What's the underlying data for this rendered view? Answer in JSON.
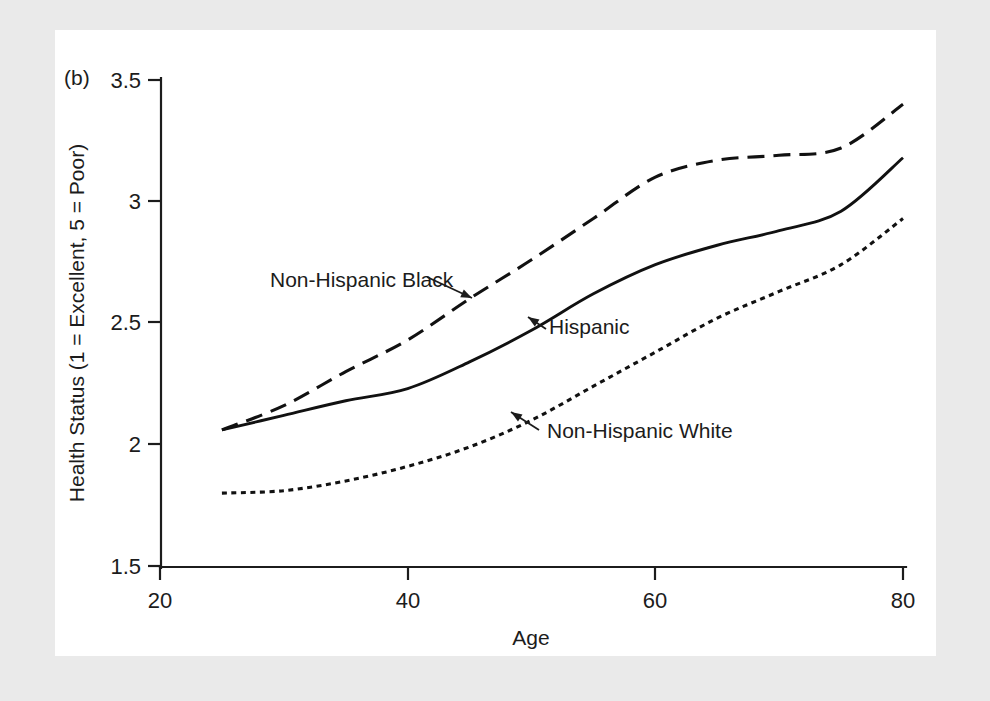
{
  "figure": {
    "panel_label": "(b)",
    "background_color": "#eaeaea",
    "plot_background_color": "#ffffff",
    "line_color": "#111111"
  },
  "chart_data": {
    "type": "line",
    "title": "",
    "subtitle": "",
    "panel": "(b)",
    "xlabel": "Age",
    "ylabel": "Health Status (1 = Excellent, 5 = Poor)",
    "xlim": [
      20,
      80
    ],
    "ylim": [
      1.5,
      3.5
    ],
    "xticks": [
      20,
      40,
      60,
      80
    ],
    "xtick_labels": [
      "20",
      "40",
      "60",
      "80"
    ],
    "yticks": [
      1.5,
      2,
      2.5,
      3,
      3.5
    ],
    "ytick_labels": [
      "1.5",
      "2",
      "2.5",
      "3",
      "3.5"
    ],
    "grid": false,
    "legend_position": "inline-annotations",
    "x": [
      25,
      30,
      35,
      40,
      45,
      50,
      55,
      60,
      65,
      70,
      75,
      80
    ],
    "series": [
      {
        "name": "Non-Hispanic Black",
        "style": "dashed",
        "dasharray": "17 9",
        "width": 3.1,
        "values": [
          2.06,
          2.16,
          2.3,
          2.43,
          2.6,
          2.76,
          2.93,
          3.1,
          3.17,
          3.19,
          3.22,
          3.4
        ]
      },
      {
        "name": "Hispanic",
        "style": "solid",
        "dasharray": "",
        "width": 2.9,
        "values": [
          2.06,
          2.12,
          2.18,
          2.23,
          2.34,
          2.47,
          2.62,
          2.74,
          2.82,
          2.88,
          2.96,
          3.18
        ]
      },
      {
        "name": "Non-Hispanic White",
        "style": "dotted",
        "dasharray": "5 4.5",
        "width": 3.1,
        "values": [
          1.8,
          1.81,
          1.85,
          1.91,
          1.99,
          2.1,
          2.24,
          2.38,
          2.52,
          2.63,
          2.74,
          2.93
        ]
      }
    ],
    "annotations": [
      {
        "text": "Non-Hispanic Black",
        "label_x": 270,
        "label_y": 287,
        "anchor": "start",
        "arrow_from_x": 427,
        "arrow_from_y": 277,
        "arrow_to_x": 472,
        "arrow_to_y": 298
      },
      {
        "text": "Hispanic",
        "label_x": 549,
        "label_y": 334,
        "anchor": "start",
        "arrow_from_x": 546,
        "arrow_from_y": 329,
        "arrow_to_x": 528,
        "arrow_to_y": 317
      },
      {
        "text": "Non-Hispanic White",
        "label_x": 547,
        "label_y": 438,
        "anchor": "start",
        "arrow_from_x": 539,
        "arrow_from_y": 430,
        "arrow_to_x": 511,
        "arrow_to_y": 412
      }
    ]
  },
  "geometry": {
    "x_pixel_at_20": 160,
    "x_pixel_at_80": 903,
    "y_pixel_at_1_5": 566,
    "y_pixel_at_3_5": 80
  }
}
